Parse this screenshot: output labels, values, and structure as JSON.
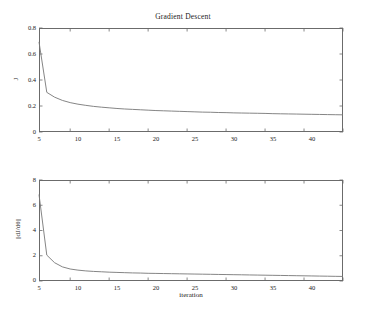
{
  "figure": {
    "title": "Gradient Descent",
    "background": "#ffffff",
    "axis_color": "#6b6b6b",
    "line_color": "#777777"
  },
  "chart_data": [
    {
      "type": "line",
      "title": "Gradient Descent",
      "xlabel": "",
      "ylabel": "J",
      "xlim": [
        1,
        40
      ],
      "ylim": [
        0,
        0.8
      ],
      "xticks": [
        5,
        10,
        15,
        20,
        25,
        30,
        35,
        40
      ],
      "xtick_labels": [
        "5",
        "10",
        "15",
        "20",
        "25",
        "30",
        "35",
        "40"
      ],
      "yticks": [
        0,
        0.2,
        0.4,
        0.6,
        0.8
      ],
      "ytick_labels": [
        "0",
        "0.2",
        "0.4",
        "0.6",
        "0.8"
      ],
      "grid": false,
      "legend": null,
      "x": [
        1,
        2,
        3,
        4,
        5,
        6,
        7,
        8,
        9,
        10,
        11,
        12,
        13,
        14,
        15,
        16,
        17,
        18,
        19,
        20,
        21,
        22,
        23,
        24,
        25,
        26,
        27,
        28,
        29,
        30,
        31,
        32,
        33,
        34,
        35,
        36,
        37,
        38,
        39,
        40
      ],
      "values": [
        0.693,
        0.305,
        0.268,
        0.243,
        0.226,
        0.214,
        0.205,
        0.197,
        0.191,
        0.186,
        0.181,
        0.177,
        0.174,
        0.171,
        0.168,
        0.165,
        0.163,
        0.161,
        0.159,
        0.157,
        0.155,
        0.153,
        0.152,
        0.15,
        0.149,
        0.147,
        0.146,
        0.145,
        0.144,
        0.143,
        0.141,
        0.14,
        0.139,
        0.138,
        0.137,
        0.136,
        0.135,
        0.134,
        0.133,
        0.132
      ]
    },
    {
      "type": "line",
      "title": "",
      "xlabel": "iteration",
      "ylabel": "||dJ/dθ||",
      "xlim": [
        1,
        40
      ],
      "ylim": [
        0,
        8
      ],
      "xticks": [
        5,
        10,
        15,
        20,
        25,
        30,
        35,
        40
      ],
      "xtick_labels": [
        "5",
        "10",
        "15",
        "20",
        "25",
        "30",
        "35",
        "40"
      ],
      "yticks": [
        0,
        2,
        4,
        6,
        8
      ],
      "ytick_labels": [
        "0",
        "2",
        "4",
        "6",
        "8"
      ],
      "grid": false,
      "legend": null,
      "x": [
        1,
        2,
        3,
        4,
        5,
        6,
        7,
        8,
        9,
        10,
        11,
        12,
        13,
        14,
        15,
        16,
        17,
        18,
        19,
        20,
        21,
        22,
        23,
        24,
        25,
        26,
        27,
        28,
        29,
        30,
        31,
        32,
        33,
        34,
        35,
        36,
        37,
        38,
        39,
        40
      ],
      "values": [
        6.85,
        2.05,
        1.45,
        1.12,
        0.95,
        0.86,
        0.8,
        0.76,
        0.73,
        0.7,
        0.68,
        0.66,
        0.64,
        0.63,
        0.61,
        0.6,
        0.59,
        0.58,
        0.57,
        0.56,
        0.55,
        0.54,
        0.53,
        0.52,
        0.51,
        0.5,
        0.49,
        0.48,
        0.47,
        0.46,
        0.45,
        0.44,
        0.43,
        0.42,
        0.41,
        0.4,
        0.39,
        0.38,
        0.37,
        0.36
      ]
    }
  ]
}
